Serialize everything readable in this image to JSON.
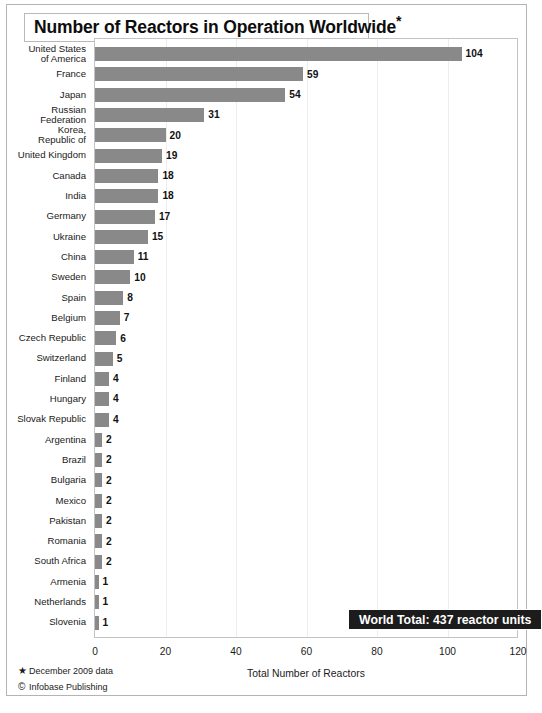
{
  "title": {
    "text": "Number of Reactors in Operation Worldwide",
    "footnote_marker": "*"
  },
  "badge": {
    "text": "World Total: 437 reactor units"
  },
  "footnotes": [
    {
      "marker": "★",
      "text": "December 2009 data"
    },
    {
      "marker": "©",
      "text": "Infobase Publishing"
    }
  ],
  "colors": {
    "bar": "#898989",
    "badge_bg": "#1c1c1c",
    "frame": "#c3c3c3",
    "grid": "#ededed"
  },
  "chart_data": {
    "type": "bar",
    "orientation": "horizontal",
    "title": "Number of Reactors in Operation Worldwide*",
    "xlabel": "Total Number of Reactors",
    "ylabel": "",
    "xlim": [
      0,
      120
    ],
    "xticks": [
      0,
      20,
      40,
      60,
      80,
      100,
      120
    ],
    "grid": true,
    "legend": null,
    "annotations": [
      "World Total: 437 reactor units"
    ],
    "categories": [
      "United States\nof America",
      "France",
      "Japan",
      "Russian\nFederation",
      "Korea,\nRepublic of",
      "United Kingdom",
      "Canada",
      "India",
      "Germany",
      "Ukraine",
      "China",
      "Sweden",
      "Spain",
      "Belgium",
      "Czech Republic",
      "Switzerland",
      "Finland",
      "Hungary",
      "Slovak Republic",
      "Argentina",
      "Brazil",
      "Bulgaria",
      "Mexico",
      "Pakistan",
      "Romania",
      "South Africa",
      "Armenia",
      "Netherlands",
      "Slovenia"
    ],
    "values": [
      104,
      59,
      54,
      31,
      20,
      19,
      18,
      18,
      17,
      15,
      11,
      10,
      8,
      7,
      6,
      5,
      4,
      4,
      4,
      2,
      2,
      2,
      2,
      2,
      2,
      2,
      1,
      1,
      1
    ],
    "total": 437
  }
}
